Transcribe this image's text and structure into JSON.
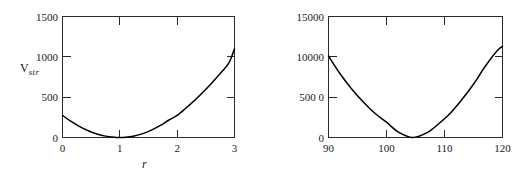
{
  "figure": {
    "background_color": "#ffffff",
    "axis_color": "#2b2b2b",
    "curve_color": "#000000"
  },
  "panels": {
    "left": {
      "name": "stretching-potential-plot",
      "ylabel_main": "V",
      "ylabel_sub": "str",
      "xlabel": "r",
      "ytick_labels": [
        "1500",
        "1000",
        "500",
        "0"
      ],
      "xtick_labels": [
        "0",
        "1",
        "2",
        "3"
      ]
    },
    "right": {
      "name": "bending-potential-plot",
      "ylabel_main": "V",
      "ylabel_sub": "b en d",
      "xlabel": "θ",
      "ytick_labels": [
        "15000",
        "10000",
        "500 0",
        "0"
      ],
      "xtick_labels": [
        "90",
        "100",
        "110",
        "120"
      ]
    }
  },
  "chart_data": [
    {
      "type": "line",
      "name": "stretching-potential",
      "title": "",
      "xlabel": "r",
      "ylabel": "V_str",
      "xlim": [
        0,
        3
      ],
      "ylim": [
        0,
        1500
      ],
      "xticks": [
        0,
        1,
        2,
        3
      ],
      "yticks": [
        0,
        500,
        1000,
        1500
      ],
      "grid": false,
      "legend": false,
      "series": [
        {
          "name": "V_str(r)",
          "color": "#000000",
          "x": [
            0.0,
            0.15,
            0.3,
            0.45,
            0.6,
            0.75,
            0.9,
            1.0,
            1.1,
            1.25,
            1.4,
            1.55,
            1.7,
            1.85,
            2.0,
            2.15,
            2.3,
            2.45,
            2.6,
            2.75,
            2.9,
            3.0
          ],
          "y": [
            275,
            199,
            135,
            83,
            44,
            17,
            3,
            0,
            3,
            19,
            48,
            91,
            146,
            214,
            275,
            363,
            457,
            561,
            672,
            793,
            921,
            1100
          ]
        }
      ]
    },
    {
      "type": "line",
      "name": "bending-potential",
      "title": "",
      "xlabel": "θ",
      "ylabel": "V_bend",
      "xlim": [
        90,
        120
      ],
      "ylim": [
        0,
        15000
      ],
      "xticks": [
        90,
        100,
        110,
        120
      ],
      "yticks": [
        0,
        5000,
        10000,
        15000
      ],
      "grid": false,
      "legend": false,
      "series": [
        {
          "name": "V_bend(theta)",
          "color": "#000000",
          "x": [
            90,
            92,
            94,
            96,
            98,
            100,
            102,
            104.5,
            107,
            109,
            111,
            113,
            115,
            117,
            119,
            120
          ],
          "y": [
            10100,
            7900,
            6000,
            4400,
            3000,
            1900,
            700,
            0,
            600,
            1700,
            3000,
            4700,
            6600,
            8800,
            10700,
            11300
          ]
        }
      ]
    }
  ]
}
